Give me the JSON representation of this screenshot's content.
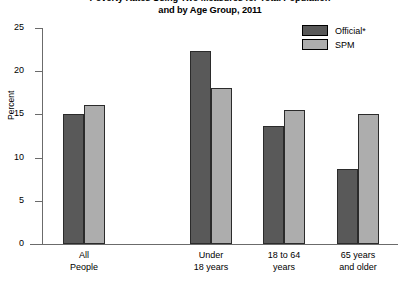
{
  "chart_data": {
    "type": "bar",
    "title": "Poverty Rates Using Two Measures for Total Population and by Age Group, 2011",
    "title_line1": "Poverty Rates Using Two Measures for Total Population",
    "title_line2": "and by Age Group, 2011",
    "xlabel": "",
    "ylabel": "Percent",
    "ylim": [
      0,
      25
    ],
    "yticks": [
      0,
      5,
      10,
      15,
      20,
      25
    ],
    "ytick_labels": [
      "0",
      "5",
      "10",
      "15",
      "20",
      "25"
    ],
    "grid": false,
    "legend_position": "top-right",
    "categories": [
      "All People",
      "Under 18 years",
      "18 to 64 years",
      "65 years and older"
    ],
    "category_lines": [
      [
        "All",
        "People"
      ],
      [
        "Under",
        "18 years"
      ],
      [
        "18 to 64",
        "years"
      ],
      [
        "65 years",
        "and older"
      ]
    ],
    "series": [
      {
        "name": "Official*",
        "color": "#595959",
        "values": [
          15.0,
          22.3,
          13.7,
          8.7
        ]
      },
      {
        "name": "SPM",
        "color": "#adadad",
        "values": [
          16.1,
          18.0,
          15.5,
          15.1
        ]
      }
    ]
  },
  "legend": {
    "items": [
      {
        "label": "Official*",
        "color": "#595959"
      },
      {
        "label": "SPM",
        "color": "#adadad"
      }
    ]
  }
}
